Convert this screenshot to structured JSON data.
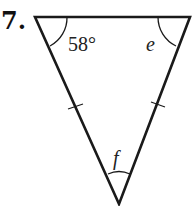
{
  "problem": {
    "number": "7."
  },
  "triangle": {
    "vertices": {
      "top_left": [
        35,
        17
      ],
      "top_right": [
        190,
        17
      ],
      "bottom": [
        119,
        204
      ]
    },
    "angles": {
      "top_left": "58°",
      "top_right": "e",
      "bottom": "f"
    },
    "congruent_sides": [
      "left",
      "right"
    ],
    "stroke_color": "#1a1a1a"
  }
}
